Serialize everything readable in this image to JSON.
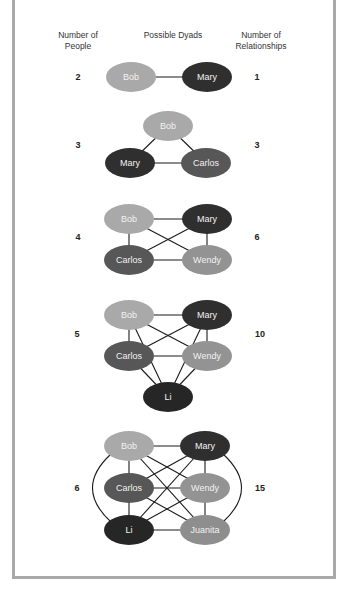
{
  "headers": {
    "people": "Number of People",
    "people_line1": "Number of",
    "people_line2": "People",
    "dyads": "Possible Dyads",
    "relationships_line1": "Number of",
    "relationships_line2": "Relationships"
  },
  "colors": {
    "Bob": "#a9a9a9",
    "Mary": "#2f2f2f",
    "Carlos": "#575757",
    "Wendy": "#939393",
    "Li": "#262626",
    "Juanita": "#8e8e8e",
    "edge": "#1a1a1a",
    "frame": "#a9a9a9"
  },
  "rows": [
    {
      "people": "2",
      "relationships": "1",
      "names": [
        "Bob",
        "Mary"
      ]
    },
    {
      "people": "3",
      "relationships": "3",
      "names": [
        "Bob",
        "Mary",
        "Carlos"
      ]
    },
    {
      "people": "4",
      "relationships": "6",
      "names": [
        "Bob",
        "Mary",
        "Carlos",
        "Wendy"
      ]
    },
    {
      "people": "5",
      "relationships": "10",
      "names": [
        "Bob",
        "Mary",
        "Carlos",
        "Wendy",
        "Li"
      ]
    },
    {
      "people": "6",
      "relationships": "15",
      "names": [
        "Bob",
        "Mary",
        "Carlos",
        "Wendy",
        "Li",
        "Juanita"
      ]
    }
  ]
}
